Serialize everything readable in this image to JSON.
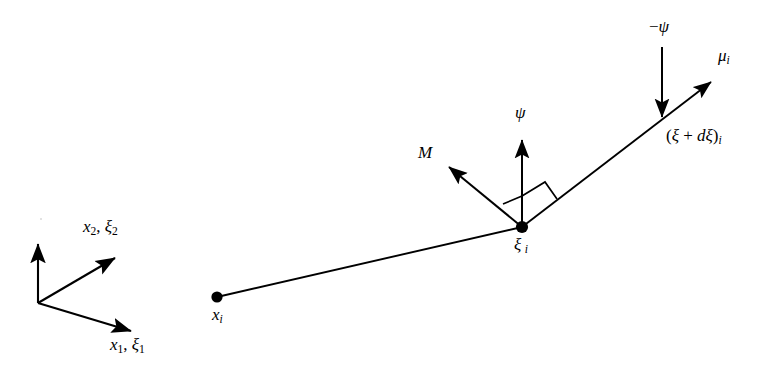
{
  "figure": {
    "name": "beam-kinematics-diagram",
    "background_color": "#ffffff",
    "stroke_color": "#000000",
    "canvas": {
      "width": 783,
      "height": 385
    }
  },
  "axes": {
    "origin": {
      "x": 38,
      "y": 303
    },
    "vertical_axis": {
      "name": "vertical-axis",
      "tip": {
        "x": 38,
        "y": 238
      }
    },
    "axis_2": {
      "name": "axis-x2-xi2",
      "tip": {
        "x": 120,
        "y": 253
      },
      "label_html": "<span class=\"it\">x</span><sub class=\"num\">2</sub><span class=\"up\">,&nbsp;</span><span class=\"it\">ξ</span><sub class=\"num\">2</sub>",
      "label_text": "x2, ξ2",
      "label_pos": {
        "x": 83,
        "y": 218
      }
    },
    "axis_1": {
      "name": "axis-x1-xi1",
      "tip": {
        "x": 137,
        "y": 334
      },
      "label_html": "<span class=\"it\">x</span><sub class=\"num\">1</sub><span class=\"up\">,&nbsp;</span><span class=\"it\">ξ</span><sub class=\"num\">1</sub>",
      "label_text": "x1, ξ1",
      "label_pos": {
        "x": 110,
        "y": 336
      }
    }
  },
  "nodes": {
    "start_node": {
      "name": "node-xi",
      "point": {
        "x": 217,
        "y": 297
      },
      "radius": 5.5,
      "label_html": "<span class=\"it\">x</span><sub>i</sub>",
      "label_text": "x i",
      "label_pos": {
        "x": 212,
        "y": 306
      }
    },
    "mid_node": {
      "name": "node-xi-i",
      "point": {
        "x": 522,
        "y": 227
      },
      "radius": 6,
      "label_html": "<span class=\"it\">ξ</span>&thinsp;<sub>i</sub>",
      "label_text": "ξ i",
      "label_pos": {
        "x": 514,
        "y": 236
      }
    }
  },
  "beam": {
    "name": "beam-element",
    "lower_segment": {
      "name": "beam-segment-lower",
      "from": {
        "x": 217,
        "y": 297
      },
      "to": {
        "x": 522,
        "y": 227
      }
    },
    "upper_segment": {
      "name": "beam-segment-upper",
      "from": {
        "x": 522,
        "y": 227
      },
      "to": {
        "x": 718,
        "y": 76
      }
    }
  },
  "vectors": {
    "psi": {
      "name": "vector-psi",
      "from": {
        "x": 522,
        "y": 227
      },
      "to": {
        "x": 522,
        "y": 134
      },
      "label_html": "<span class=\"it\">ψ</span>",
      "label_text": "ψ",
      "label_pos": {
        "x": 515,
        "y": 104
      }
    },
    "neg_psi": {
      "name": "vector-negative-psi",
      "from": {
        "x": 662,
        "y": 47
      },
      "to": {
        "x": 662,
        "y": 123
      },
      "label_html": "<span class=\"up\">−</span><span class=\"it\">ψ</span>",
      "label_text": "−ψ",
      "label_pos": {
        "x": 649,
        "y": 18
      }
    },
    "moment": {
      "name": "vector-moment-M",
      "double_headed": true,
      "from": {
        "x": 522,
        "y": 227
      },
      "to": {
        "x": 443,
        "y": 162
      },
      "label_html": "<span class=\"it\">M</span>",
      "label_text": "M",
      "label_pos": {
        "x": 418,
        "y": 144
      }
    },
    "mu": {
      "name": "vector-mu-i",
      "from": {
        "x": 522,
        "y": 227
      },
      "to": {
        "x": 718,
        "y": 76
      },
      "label_html": "<span class=\"it\">μ</span><sub>i</sub>",
      "label_text": "μ i",
      "label_pos": {
        "x": 718,
        "y": 47
      }
    }
  },
  "annotations": {
    "xi_plus_dxi": {
      "name": "label-xi-plus-dxi",
      "label_html": "<span class=\"up\">(</span><span class=\"it\">ξ</span><span class=\"up\">&nbsp;+&nbsp;</span><span class=\"it\">d</span><span class=\"it\">ξ</span><span class=\"up\">)</span><sub>i</sub>",
      "label_text": "(ξ + dξ)i",
      "label_pos": {
        "x": 666,
        "y": 127
      }
    },
    "right_angle_left": {
      "name": "right-angle-marker-left",
      "size": 22,
      "description": "right angle between moment vector M and psi vector"
    },
    "right_angle_right": {
      "name": "right-angle-marker-right",
      "size": 26,
      "description": "right angle between psi vector and beam director mu"
    }
  }
}
